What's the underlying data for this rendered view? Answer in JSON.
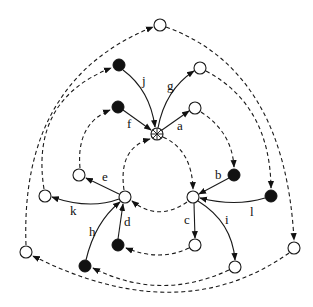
{
  "diagram": {
    "type": "directed-graph",
    "colors": {
      "stroke": "#1a1a1a",
      "filled_node": "#111111",
      "open_node": "#ffffff",
      "background": "#ffffff"
    },
    "nodes": [
      {
        "id": "center",
        "kind": "star",
        "x": 157,
        "y": 134
      },
      {
        "id": "top",
        "kind": "open",
        "x": 160,
        "y": 25
      },
      {
        "id": "j_src",
        "kind": "filled",
        "x": 119,
        "y": 65
      },
      {
        "id": "g_tgt",
        "kind": "open",
        "x": 200,
        "y": 68
      },
      {
        "id": "f_src",
        "kind": "filled",
        "x": 118,
        "y": 107
      },
      {
        "id": "a_tgt",
        "kind": "open",
        "x": 195,
        "y": 108
      },
      {
        "id": "left_hub",
        "kind": "open",
        "x": 125,
        "y": 197
      },
      {
        "id": "right_hub",
        "kind": "open",
        "x": 193,
        "y": 197
      },
      {
        "id": "e_tgt",
        "kind": "open",
        "x": 79,
        "y": 175
      },
      {
        "id": "k_tgt",
        "kind": "open",
        "x": 45,
        "y": 196
      },
      {
        "id": "b_src",
        "kind": "filled",
        "x": 234,
        "y": 175
      },
      {
        "id": "l_src",
        "kind": "filled",
        "x": 271,
        "y": 196
      },
      {
        "id": "d_src",
        "kind": "filled",
        "x": 118,
        "y": 245
      },
      {
        "id": "h_src",
        "kind": "filled",
        "x": 85,
        "y": 266
      },
      {
        "id": "c_tgt",
        "kind": "open",
        "x": 195,
        "y": 245
      },
      {
        "id": "i_tgt",
        "kind": "open",
        "x": 235,
        "y": 267
      },
      {
        "id": "left_outer",
        "kind": "open",
        "x": 26,
        "y": 252
      },
      {
        "id": "right_outer",
        "kind": "open",
        "x": 294,
        "y": 248
      }
    ],
    "solid_edges": [
      {
        "label": "a",
        "from": "center",
        "to": "a_tgt"
      },
      {
        "label": "b",
        "from": "b_src",
        "to": "right_hub"
      },
      {
        "label": "c",
        "from": "right_hub",
        "to": "c_tgt"
      },
      {
        "label": "d",
        "from": "d_src",
        "to": "left_hub"
      },
      {
        "label": "e",
        "from": "left_hub",
        "to": "e_tgt"
      },
      {
        "label": "f",
        "from": "f_src",
        "to": "center"
      },
      {
        "label": "g",
        "from": "center",
        "to": "g_tgt"
      },
      {
        "label": "h",
        "from": "h_src",
        "to": "left_hub"
      },
      {
        "label": "i",
        "from": "right_hub",
        "to": "i_tgt"
      },
      {
        "label": "j",
        "from": "j_src",
        "to": "center"
      },
      {
        "label": "k",
        "from": "left_hub",
        "to": "k_tgt"
      },
      {
        "label": "l",
        "from": "l_src",
        "to": "right_hub"
      }
    ],
    "dashed_edges": [
      {
        "from": "center",
        "to": "right_hub"
      },
      {
        "from": "right_hub",
        "to": "left_hub"
      },
      {
        "from": "left_hub",
        "to": "center"
      },
      {
        "from": "a_tgt",
        "to": "b_src"
      },
      {
        "from": "c_tgt",
        "to": "d_src"
      },
      {
        "from": "e_tgt",
        "to": "f_src"
      },
      {
        "from": "g_tgt",
        "to": "l_src"
      },
      {
        "from": "i_tgt",
        "to": "h_src"
      },
      {
        "from": "k_tgt",
        "to": "j_src"
      },
      {
        "from": "top",
        "to": "right_outer"
      },
      {
        "from": "right_outer",
        "to": "left_outer"
      },
      {
        "from": "left_outer",
        "to": "top"
      }
    ],
    "labels": {
      "a": "a",
      "b": "b",
      "c": "c",
      "d": "d",
      "e": "e",
      "f": "f",
      "g": "g",
      "h": "h",
      "i": "i",
      "j": "j",
      "k": "k",
      "l": "l"
    }
  }
}
